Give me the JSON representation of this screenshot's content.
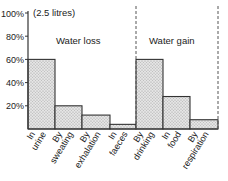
{
  "chart_data": {
    "type": "bar",
    "title": "",
    "ylabel": "",
    "xlabel": "",
    "unit_note": "(2.5 litres)",
    "ylim": [
      0,
      100
    ],
    "yticks": [
      "20%",
      "40%",
      "60%",
      "80%",
      "100%"
    ],
    "ytick_values": [
      20,
      40,
      60,
      80,
      100
    ],
    "grid": false,
    "legend": null,
    "groups": [
      {
        "name": "Water loss",
        "categories": [
          "In urine",
          "By sweating",
          "By exhalation",
          "In faeces"
        ]
      },
      {
        "name": "Water gain",
        "categories": [
          "By drinking",
          "In food",
          "By respiration"
        ]
      }
    ],
    "categories": [
      "In urine",
      "By sweating",
      "By exhalation",
      "In faeces",
      "By drinking",
      "In food",
      "By respiration"
    ],
    "tick_lines": [
      [
        "In",
        "urine"
      ],
      [
        "By",
        "sweating"
      ],
      [
        "By",
        "exhalation"
      ],
      [
        "In",
        "faeces"
      ],
      [
        "By",
        "drinking"
      ],
      [
        "In",
        "food"
      ],
      [
        "By",
        "respiration"
      ]
    ],
    "values": [
      60,
      20,
      12,
      4,
      60,
      28,
      8
    ]
  },
  "colors": {
    "bar_fill": "#dcdcdc",
    "bar_stroke": "#333333",
    "axis": "#333333",
    "divider": "#555555"
  }
}
